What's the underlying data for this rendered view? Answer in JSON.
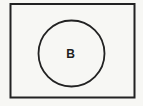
{
  "diagram": {
    "type": "venn",
    "universal_set": {
      "label": "",
      "shape": "rectangle"
    },
    "sets": [
      {
        "label": "B",
        "shape": "circle"
      }
    ],
    "colors": {
      "background": "#f7f7f4",
      "stroke": "#222222"
    }
  }
}
